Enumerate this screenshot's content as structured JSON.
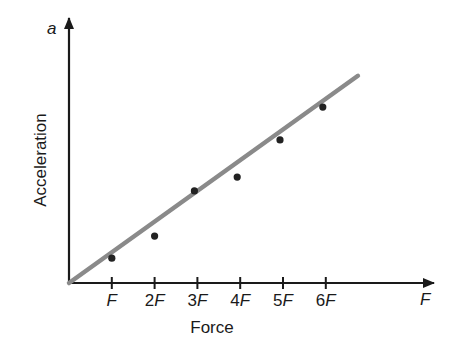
{
  "chart_data": {
    "type": "scatter",
    "title": "",
    "xlabel": "Force",
    "ylabel": "Acceleration",
    "x_axis_symbol": "F",
    "y_axis_symbol": "a",
    "x_tick_labels": [
      "F",
      "2F",
      "3F",
      "4F",
      "5F",
      "6F"
    ],
    "x": [
      1,
      2,
      3,
      4,
      5,
      6
    ],
    "series": [
      {
        "name": "measured",
        "kind": "points",
        "values": [
          0.81,
          1.53,
          3.0,
          3.45,
          4.66,
          5.73
        ],
        "color": "#222222"
      },
      {
        "name": "best-fit line",
        "kind": "line",
        "x": [
          0,
          6.75
        ],
        "values": [
          0,
          6.75
        ],
        "color": "#8a8a8a"
      }
    ],
    "xlim": [
      0,
      7.7
    ],
    "ylim": [
      0,
      8.6
    ],
    "grid": false,
    "legend": null,
    "y_ticks_labeled": false
  }
}
